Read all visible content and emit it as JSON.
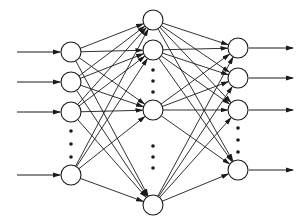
{
  "diagram": {
    "type": "feedforward-neural-network",
    "colors": {
      "stroke": "#1a1a1a",
      "node_fill": "#ffffff",
      "background": "#ffffff"
    },
    "node_radius": 10,
    "layers": [
      {
        "name": "input",
        "x": 71,
        "nodes_y": [
          52,
          82,
          112,
          175
        ],
        "ellipsis_y": [
          131,
          144,
          157
        ],
        "incoming_arrows": true
      },
      {
        "name": "hidden",
        "x": 153,
        "nodes_y": [
          20,
          50,
          110,
          205
        ],
        "ellipsis_y": [
          [
            70,
            81,
            92
          ],
          [
            146,
            157,
            168
          ]
        ]
      },
      {
        "name": "output",
        "x": 238,
        "nodes_y": [
          48,
          78,
          110,
          170
        ],
        "ellipsis_y": [
          128,
          140,
          152
        ],
        "outgoing_arrows": true
      }
    ],
    "input_arrow_x": [
      17,
      60
    ],
    "output_arrow_x": [
      249,
      293
    ]
  }
}
